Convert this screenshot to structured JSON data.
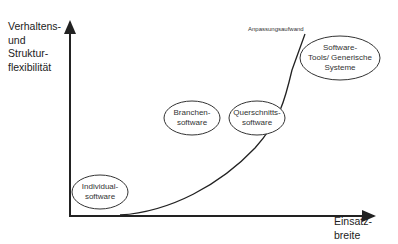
{
  "diagram": {
    "y_axis_label": [
      "Verhaltens-",
      "und",
      "Struktur-",
      "flexibilität"
    ],
    "x_axis_label": [
      "Einsatz-",
      "breite"
    ],
    "curve_annotation": "Anpassungsaufwand",
    "nodes": [
      {
        "id": "individual",
        "lines": [
          "Individual-",
          "software"
        ]
      },
      {
        "id": "branchen",
        "lines": [
          "Branchen-",
          "software"
        ]
      },
      {
        "id": "querschnitt",
        "lines": [
          "Querschnitts-",
          "software"
        ]
      },
      {
        "id": "tools",
        "lines": [
          "Software-",
          "Tools/ Generische",
          "Systeme"
        ]
      }
    ],
    "colors": {
      "line": "#222222",
      "ellipse_stroke": "#333333",
      "background": "#ffffff"
    }
  }
}
